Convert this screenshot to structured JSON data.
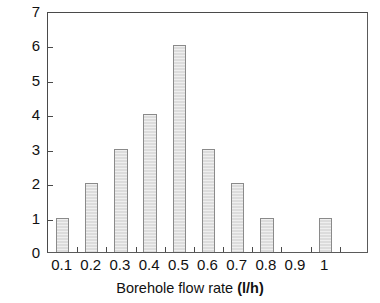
{
  "chart_data": {
    "type": "bar",
    "title": "",
    "xlabel": "Borehole flow rate (l/h)",
    "xlabel_main": "Borehole flow rate",
    "xlabel_unit": "(l/h)",
    "ylabel": "Frequency",
    "categories": [
      "0.1",
      "0.2",
      "0.3",
      "0.4",
      "0.5",
      "0.6",
      "0.7",
      "0.8",
      "0.9",
      "1"
    ],
    "values": [
      1,
      2,
      3,
      4,
      6,
      3,
      2,
      1,
      0,
      1
    ],
    "ylim": [
      0,
      7
    ],
    "ytick_labels": [
      "0",
      "1",
      "2",
      "3",
      "4",
      "5",
      "6",
      "7"
    ],
    "ytick_values": [
      0,
      1,
      2,
      3,
      4,
      5,
      6,
      7
    ],
    "xtick_labels": [
      "0.1",
      "0.2",
      "0.3",
      "0.4",
      "0.5",
      "0.6",
      "0.7",
      "0.8",
      "0.9",
      "1"
    ],
    "grid": false,
    "legend": false,
    "legend_position": "none",
    "bar_fill_color": "#dcdcdc",
    "bar_border_color": "#8a8a8a",
    "axis_color": "#4a4a4a",
    "background_color": "#ffffff",
    "n_extra_trailing_tick": 1
  }
}
